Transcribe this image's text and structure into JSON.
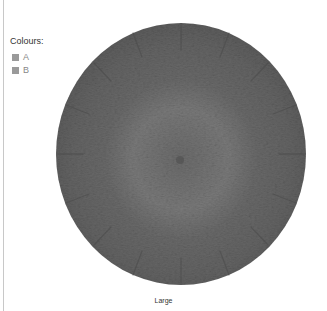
{
  "legend": {
    "title": "Colours:",
    "items": [
      {
        "label": "A",
        "swatch_color": "#9a9a9a"
      },
      {
        "label": "B",
        "swatch_color": "#9a9a9a"
      }
    ]
  },
  "product": {
    "image": "knitted-beret-top-view",
    "rim_color": "#5f5f5f",
    "crown_color": "#7a7a7a"
  },
  "caption": "Large"
}
